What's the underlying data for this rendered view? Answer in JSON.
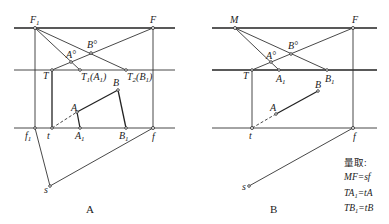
{
  "diagram_a": {
    "caption": "A",
    "labels": {
      "F1": "F",
      "F1_sub": "1",
      "F": "F",
      "B_deg": "B°",
      "A_deg": "A°",
      "T": "T",
      "T1A1": "T",
      "T1A1_sub": "1",
      "T1A1_rest": "(A",
      "T1A1_sub2": "1",
      "T1A1_close": ")",
      "T2B1": "T",
      "T2B1_sub": "2",
      "T2B1_rest": "(B",
      "T2B1_sub2": "1",
      "T2B1_close": ")",
      "A": "A",
      "B": "B",
      "f1": "f",
      "f1_sub": "1",
      "t": "t",
      "A1": "A",
      "A1_sub": "1",
      "B1": "B",
      "B1_sub": "1",
      "f": "f",
      "s": "s"
    }
  },
  "diagram_b": {
    "caption": "B",
    "labels": {
      "M": "M",
      "F": "F",
      "B_deg": "B°",
      "A_deg": "A°",
      "T": "T",
      "A1": "A",
      "A1_sub": "1",
      "B1": "B",
      "B1_sub": "1",
      "A": "A",
      "B": "B",
      "t": "t",
      "f": "f",
      "s": "s"
    },
    "notes": {
      "title": "量取:",
      "line1": "MF=sf",
      "line2_a": "TA",
      "line2_sub": "1",
      "line2_b": "=tA",
      "line3_a": "TB",
      "line3_sub": "1",
      "line3_b": "=tB"
    }
  }
}
